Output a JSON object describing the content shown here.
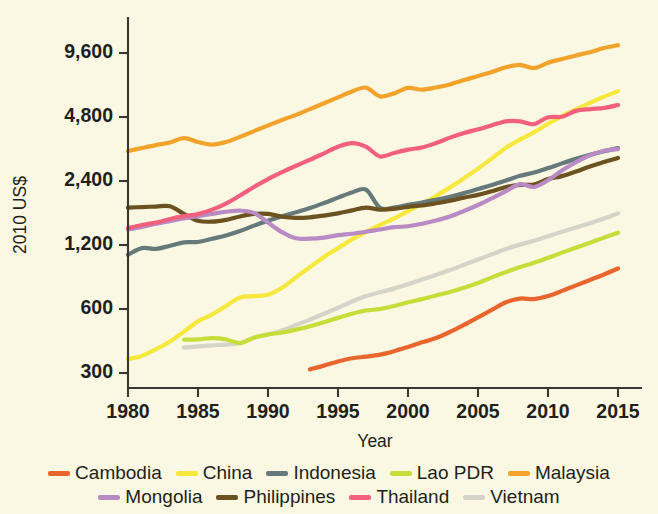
{
  "chart_data": {
    "type": "line",
    "title": "",
    "xlabel": "Year",
    "ylabel": "2010 US$",
    "yscale": "log",
    "ylim": [
      270,
      12000
    ],
    "xlim": [
      1980,
      2015
    ],
    "grid": false,
    "legend_position": "bottom",
    "ytick_labels": [
      "9,600",
      "4,800",
      "2,400",
      "1,200",
      "600",
      "300"
    ],
    "ytick_values": [
      9600,
      4800,
      2400,
      1200,
      600,
      300
    ],
    "xtick_labels": [
      "1980",
      "1985",
      "1990",
      "1995",
      "2000",
      "2005",
      "2010",
      "2015"
    ],
    "xtick_values": [
      1980,
      1985,
      1990,
      1995,
      2000,
      2005,
      2010,
      2015
    ],
    "series": [
      {
        "name": "Cambodia",
        "color": "#E8662E",
        "x": [
          1993,
          1994,
          1995,
          1996,
          1997,
          1998,
          1999,
          2000,
          2001,
          2002,
          2003,
          2004,
          2005,
          2006,
          2007,
          2008,
          2009,
          2010,
          2011,
          2012,
          2013,
          2014,
          2015
        ],
        "values": [
          312,
          325,
          340,
          352,
          358,
          366,
          380,
          398,
          418,
          438,
          468,
          505,
          548,
          595,
          645,
          672,
          668,
          690,
          730,
          775,
          822,
          872,
          930
        ]
      },
      {
        "name": "China",
        "color": "#F6E83C",
        "x": [
          1980,
          1981,
          1982,
          1983,
          1984,
          1985,
          1986,
          1987,
          1988,
          1989,
          1990,
          1991,
          1992,
          1993,
          1994,
          1995,
          1996,
          1997,
          1998,
          1999,
          2000,
          2001,
          2002,
          2003,
          2004,
          2005,
          2006,
          2007,
          2008,
          2009,
          2010,
          2011,
          2012,
          2013,
          2014,
          2015
        ],
        "values": [
          348,
          362,
          388,
          422,
          470,
          525,
          565,
          620,
          680,
          690,
          700,
          755,
          845,
          945,
          1055,
          1160,
          1275,
          1385,
          1490,
          1600,
          1730,
          1875,
          2040,
          2240,
          2475,
          2745,
          3065,
          3440,
          3760,
          4070,
          4460,
          4850,
          5215,
          5590,
          5975,
          6350
        ]
      },
      {
        "name": "Indonesia",
        "color": "#667A7C",
        "x": [
          1980,
          1981,
          1982,
          1983,
          1984,
          1985,
          1986,
          1987,
          1988,
          1989,
          1990,
          1991,
          1992,
          1993,
          1994,
          1995,
          1996,
          1997,
          1998,
          1999,
          2000,
          2001,
          2002,
          2003,
          2004,
          2005,
          2006,
          2007,
          2008,
          2009,
          2010,
          2011,
          2012,
          2013,
          2014,
          2015
        ],
        "values": [
          1080,
          1160,
          1150,
          1190,
          1235,
          1240,
          1285,
          1330,
          1395,
          1480,
          1560,
          1640,
          1710,
          1790,
          1890,
          2005,
          2120,
          2185,
          1795,
          1800,
          1855,
          1900,
          1960,
          2025,
          2105,
          2200,
          2300,
          2415,
          2540,
          2630,
          2760,
          2905,
          3050,
          3185,
          3310,
          3430
        ]
      },
      {
        "name": "Lao PDR",
        "color": "#C5DE39",
        "x": [
          1984,
          1985,
          1986,
          1987,
          1988,
          1989,
          1990,
          1991,
          1992,
          1993,
          1994,
          1995,
          1996,
          1997,
          1998,
          1999,
          2000,
          2001,
          2002,
          2003,
          2004,
          2005,
          2006,
          2007,
          2008,
          2009,
          2010,
          2011,
          2012,
          2013,
          2014,
          2015
        ],
        "values": [
          430,
          432,
          438,
          432,
          415,
          440,
          455,
          465,
          480,
          498,
          520,
          545,
          570,
          590,
          600,
          620,
          645,
          668,
          695,
          722,
          755,
          795,
          845,
          895,
          945,
          990,
          1045,
          1105,
          1165,
          1230,
          1300,
          1370
        ]
      },
      {
        "name": "Malaysia",
        "color": "#F2A32B",
        "x": [
          1980,
          1981,
          1982,
          1983,
          1984,
          1985,
          1986,
          1987,
          1988,
          1989,
          1990,
          1991,
          1992,
          1993,
          1994,
          1995,
          1996,
          1997,
          1998,
          1999,
          2000,
          2001,
          2002,
          2003,
          2004,
          2005,
          2006,
          2007,
          2008,
          2009,
          2010,
          2011,
          2012,
          2013,
          2014,
          2015
        ],
        "values": [
          3320,
          3430,
          3540,
          3640,
          3820,
          3660,
          3560,
          3660,
          3870,
          4120,
          4380,
          4650,
          4910,
          5230,
          5570,
          5940,
          6330,
          6600,
          6000,
          6200,
          6580,
          6460,
          6610,
          6830,
          7160,
          7480,
          7820,
          8220,
          8450,
          8160,
          8640,
          9000,
          9350,
          9680,
          10130,
          10450
        ]
      },
      {
        "name": "Mongolia",
        "color": "#B98BC4",
        "x": [
          1980,
          1981,
          1982,
          1983,
          1984,
          1985,
          1986,
          1987,
          1988,
          1989,
          1990,
          1991,
          1992,
          1993,
          1994,
          1995,
          1996,
          1997,
          1998,
          1999,
          2000,
          2001,
          2002,
          2003,
          2004,
          2005,
          2006,
          2007,
          2008,
          2009,
          2010,
          2011,
          2012,
          2013,
          2014,
          2015
        ],
        "values": [
          1420,
          1460,
          1510,
          1555,
          1600,
          1640,
          1680,
          1720,
          1740,
          1700,
          1530,
          1380,
          1290,
          1285,
          1300,
          1335,
          1355,
          1385,
          1420,
          1455,
          1470,
          1510,
          1565,
          1635,
          1735,
          1850,
          1990,
          2150,
          2320,
          2250,
          2420,
          2690,
          2940,
          3170,
          3330,
          3390
        ]
      },
      {
        "name": "Philippines",
        "color": "#6B5220",
        "x": [
          1980,
          1981,
          1982,
          1983,
          1984,
          1985,
          1986,
          1987,
          1988,
          1989,
          1990,
          1991,
          1992,
          1993,
          1994,
          1995,
          1996,
          1997,
          1998,
          1999,
          2000,
          2001,
          2002,
          2003,
          2004,
          2005,
          2006,
          2007,
          2008,
          2009,
          2010,
          2011,
          2012,
          2013,
          2014,
          2015
        ],
        "values": [
          1800,
          1810,
          1820,
          1825,
          1680,
          1560,
          1545,
          1575,
          1635,
          1680,
          1680,
          1630,
          1610,
          1620,
          1650,
          1690,
          1745,
          1800,
          1760,
          1775,
          1815,
          1840,
          1885,
          1940,
          2005,
          2065,
          2150,
          2250,
          2300,
          2310,
          2450,
          2530,
          2660,
          2810,
          2945,
          3080
        ]
      },
      {
        "name": "Thailand",
        "color": "#F2607E",
        "x": [
          1980,
          1981,
          1982,
          1983,
          1984,
          1985,
          1986,
          1987,
          1988,
          1989,
          1990,
          1991,
          1992,
          1993,
          1994,
          1995,
          1996,
          1997,
          1998,
          1999,
          2000,
          2001,
          2002,
          2003,
          2004,
          2005,
          2006,
          2007,
          2008,
          2009,
          2010,
          2011,
          2012,
          2013,
          2014,
          2015
        ],
        "values": [
          1440,
          1490,
          1530,
          1590,
          1640,
          1680,
          1760,
          1880,
          2050,
          2250,
          2450,
          2640,
          2830,
          3020,
          3240,
          3480,
          3620,
          3480,
          3130,
          3250,
          3370,
          3450,
          3620,
          3840,
          4040,
          4200,
          4390,
          4580,
          4580,
          4440,
          4790,
          4810,
          5130,
          5230,
          5290,
          5470
        ]
      },
      {
        "name": "Vietnam",
        "color": "#D5D4C9",
        "x": [
          1984,
          1985,
          1986,
          1987,
          1988,
          1989,
          1990,
          1991,
          1992,
          1993,
          1994,
          1995,
          1996,
          1997,
          1998,
          1999,
          2000,
          2001,
          2002,
          2003,
          2004,
          2005,
          2006,
          2007,
          2008,
          2009,
          2010,
          2011,
          2012,
          2013,
          2014,
          2015
        ],
        "values": [
          395,
          400,
          405,
          408,
          415,
          440,
          455,
          475,
          505,
          535,
          570,
          608,
          650,
          690,
          720,
          748,
          785,
          825,
          868,
          915,
          968,
          1025,
          1085,
          1150,
          1205,
          1255,
          1320,
          1385,
          1450,
          1520,
          1600,
          1690
        ]
      }
    ]
  },
  "legend": {
    "row1": [
      {
        "label": "Cambodia",
        "color": "#E8662E"
      },
      {
        "label": "China",
        "color": "#F6E83C"
      },
      {
        "label": "Indonesia",
        "color": "#667A7C"
      },
      {
        "label": "Lao PDR",
        "color": "#C5DE39"
      },
      {
        "label": "Malaysia",
        "color": "#F2A32B"
      }
    ],
    "row2": [
      {
        "label": "Mongolia",
        "color": "#B98BC4"
      },
      {
        "label": "Philippines",
        "color": "#6B5220"
      },
      {
        "label": "Thailand",
        "color": "#F2607E"
      },
      {
        "label": "Vietnam",
        "color": "#D5D4C9"
      }
    ]
  }
}
